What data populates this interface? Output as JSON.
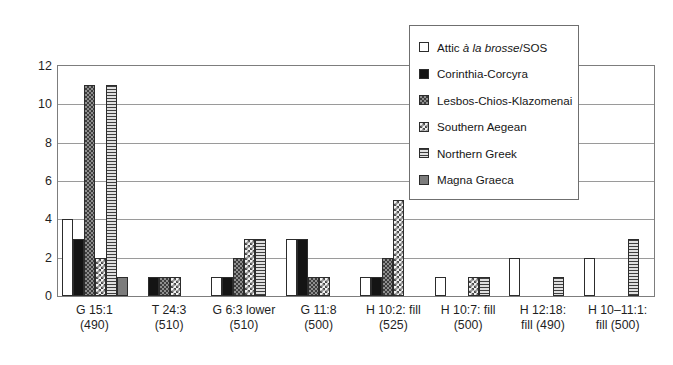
{
  "chart_data": {
    "type": "bar",
    "title": "",
    "xlabel": "",
    "ylabel": "",
    "ylim": [
      0,
      12
    ],
    "yticks": [
      0,
      2,
      4,
      6,
      8,
      10,
      12
    ],
    "grid": true,
    "legend_position": "top-right",
    "categories": [
      "G 15:1 (490)",
      "T 24:3 (510)",
      "G 6:3 lower (510)",
      "G 11:8 (500)",
      "H 10:2: fill (525)",
      "H 10:7: fill (500)",
      "H 12:18: fill (490)",
      "H 10–11:1: fill (500)"
    ],
    "category_lines": [
      {
        "l1": "G 15:1",
        "l2": "(490)"
      },
      {
        "l1": "T 24:3",
        "l2": "(510)"
      },
      {
        "l1": "G 6:3 lower",
        "l2": "(510)"
      },
      {
        "l1": "G 11:8",
        "l2": "(500)"
      },
      {
        "l1": "H 10:2: fill",
        "l2": "(525)"
      },
      {
        "l1": "H 10:7: fill",
        "l2": "(500)"
      },
      {
        "l1": "H 12:18:",
        "l2": "fill (490)"
      },
      {
        "l1": "H 10–11:1:",
        "l2": "fill (500)"
      }
    ],
    "series": [
      {
        "name": "Attic à la brosse/SOS",
        "key": "attic",
        "fill": "white",
        "values": [
          4,
          0,
          1,
          3,
          1,
          1,
          2,
          2
        ]
      },
      {
        "name": "Corinthia-Corcyra",
        "key": "corinthia",
        "fill": "solid-black",
        "values": [
          3,
          1,
          1,
          3,
          1,
          0,
          0,
          0
        ]
      },
      {
        "name": "Lesbos-Chios-Klazomenai",
        "key": "lesbos",
        "fill": "dark-checker",
        "values": [
          11,
          1,
          2,
          1,
          2,
          0,
          0,
          0
        ]
      },
      {
        "name": "Southern Aegean",
        "key": "aegean",
        "fill": "light-checker",
        "values": [
          2,
          1,
          3,
          1,
          5,
          1,
          0,
          0
        ]
      },
      {
        "name": "Northern Greek",
        "key": "northern",
        "fill": "horizontal-lines",
        "values": [
          11,
          0,
          3,
          0,
          0,
          1,
          1,
          3
        ]
      },
      {
        "name": "Magna Graeca",
        "key": "magna",
        "fill": "solid-grey",
        "values": [
          1,
          0,
          0,
          0,
          0,
          0,
          0,
          0
        ]
      }
    ]
  },
  "legend": {
    "items": [
      {
        "label_pre": "Attic ",
        "label_italic": "à la brosse",
        "label_post": "/SOS",
        "key": "attic"
      },
      {
        "label_pre": "Corinthia-Corcyra",
        "label_italic": "",
        "label_post": "",
        "key": "corinthia"
      },
      {
        "label_pre": "Lesbos-Chios-Klazomenai",
        "label_italic": "",
        "label_post": "",
        "key": "lesbos"
      },
      {
        "label_pre": "Southern Aegean",
        "label_italic": "",
        "label_post": "",
        "key": "aegean"
      },
      {
        "label_pre": "Northern Greek",
        "label_italic": "",
        "label_post": "",
        "key": "northern"
      },
      {
        "label_pre": "Magna Graeca",
        "label_italic": "",
        "label_post": "",
        "key": "magna"
      }
    ]
  },
  "colors": {
    "axis": "#7d7d7d",
    "gridline": "#9a9a9a",
    "bar_outline": "#2c2c2c",
    "text": "#1a1a1a",
    "background": "#ffffff"
  }
}
